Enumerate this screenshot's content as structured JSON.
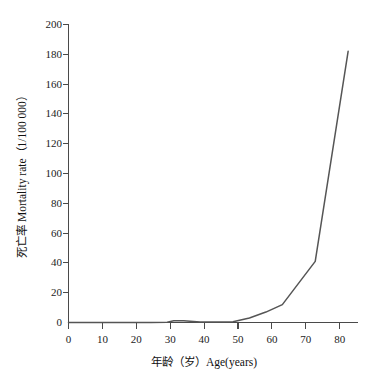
{
  "chart_data": {
    "type": "line",
    "title": "",
    "subtitle": "",
    "xlabel": "年龄（岁）Age(years)",
    "ylabel": "死亡率 Mortality rate（1/100 000）",
    "xlim": [
      0,
      88
    ],
    "ylim": [
      0,
      200
    ],
    "xticks": [
      0,
      10,
      20,
      30,
      40,
      50,
      60,
      70,
      80
    ],
    "yticks": [
      0,
      20,
      40,
      60,
      80,
      100,
      120,
      140,
      160,
      180,
      200
    ],
    "xtick_labels": [
      "0",
      "10",
      "20",
      "30",
      "40",
      "50",
      "60",
      "70",
      "80"
    ],
    "ytick_labels": [
      "0",
      "20",
      "40",
      "60",
      "80",
      "100",
      "120",
      "140",
      "160",
      "180",
      "200"
    ],
    "grid": false,
    "legend": false,
    "legend_position": "none",
    "line_color": "#555555",
    "axis_color": "#4a4a4a",
    "background_color": "#ffffff",
    "series": [
      {
        "name": "死亡率 Mortality rate",
        "x": [
          0,
          5,
          10,
          15,
          20,
          25,
          30,
          32,
          35,
          40,
          45,
          50,
          55,
          60,
          65,
          75,
          85
        ],
        "values": [
          0,
          0,
          0,
          0,
          0,
          0,
          0.2,
          1.2,
          1.2,
          0.3,
          0.3,
          0.5,
          3,
          7,
          12,
          41,
          182
        ]
      }
    ],
    "annotations": []
  },
  "axis_titles": {
    "x": "年龄（岁）Age(years)",
    "y": "死亡率 Mortality rate（1/100 000）"
  }
}
